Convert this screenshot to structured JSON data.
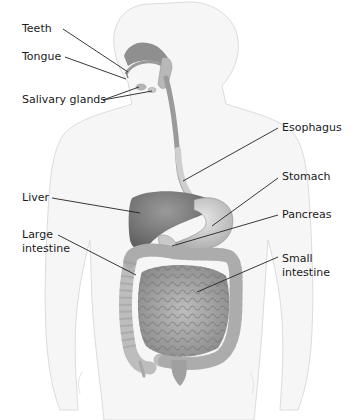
{
  "diagram": {
    "type": "anatomical-labeled-illustration",
    "labels": [
      {
        "id": "teeth",
        "text": "Teeth",
        "x": 22,
        "y": 22,
        "line": [
          [
            63,
            29
          ],
          [
            128,
            72
          ]
        ]
      },
      {
        "id": "tongue",
        "text": "Tongue",
        "x": 22,
        "y": 50,
        "line": [
          [
            65,
            57
          ],
          [
            126,
            79
          ]
        ]
      },
      {
        "id": "salivary",
        "text": "Salivary glands",
        "x": 22,
        "y": 93,
        "line": [
          [
            103,
            100
          ],
          [
            139,
            87
          ]
        ],
        "line2": [
          [
            103,
            100
          ],
          [
            152,
            91
          ]
        ]
      },
      {
        "id": "esophagus",
        "text": "Esophagus",
        "x": 282,
        "y": 121,
        "line": [
          [
            278,
            128
          ],
          [
            183,
            181
          ]
        ]
      },
      {
        "id": "stomach",
        "text": "Stomach",
        "x": 282,
        "y": 170,
        "line": [
          [
            278,
            178
          ],
          [
            212,
            226
          ]
        ]
      },
      {
        "id": "pancreas",
        "text": "Pancreas",
        "x": 282,
        "y": 208,
        "line": [
          [
            278,
            215
          ],
          [
            172,
            246
          ]
        ]
      },
      {
        "id": "liver",
        "text": "Liver",
        "x": 22,
        "y": 193,
        "line": [
          [
            52,
            198
          ],
          [
            140,
            213
          ]
        ]
      },
      {
        "id": "large",
        "text": "Large\nintestine",
        "lines": [
          "Large",
          "intestine"
        ],
        "x": 22,
        "y": 229,
        "line": [
          [
            58,
            235
          ],
          [
            136,
            275
          ]
        ]
      },
      {
        "id": "small",
        "text": "Small\nintestine",
        "lines": [
          "Small",
          "intestine"
        ],
        "x": 282,
        "y": 253,
        "line": [
          [
            278,
            257
          ],
          [
            197,
            292
          ]
        ]
      }
    ],
    "colors": {
      "body_outline": "#d8d8d8",
      "body_fill": "#f4f4f4",
      "organ_dark": "#7d7d7d",
      "organ_mid": "#a8a8a8",
      "organ_light": "#cfcfcf",
      "leader_line": "#222222",
      "text": "#1a1a1a"
    }
  }
}
